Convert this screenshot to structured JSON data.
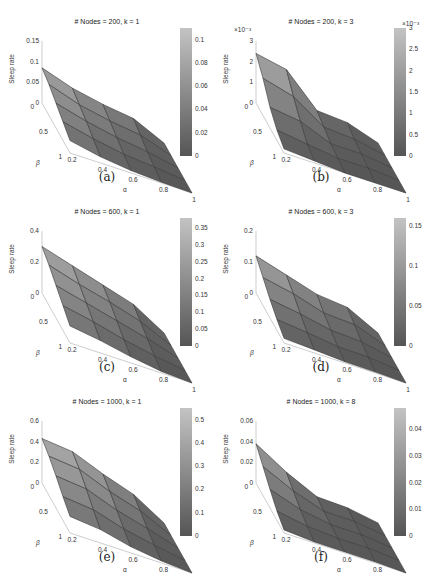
{
  "figure": {
    "panels": [
      {
        "id": "a",
        "caption": "(a)",
        "title": "# Nodes = 200,  k = 1"
      },
      {
        "id": "b",
        "caption": "(b)",
        "title": "# Nodes = 200,  k = 3"
      },
      {
        "id": "c",
        "caption": "(c)",
        "title": "# Nodes = 600,  k = 1"
      },
      {
        "id": "d",
        "caption": "(d)",
        "title": "# Nodes = 600,  k = 3"
      },
      {
        "id": "e",
        "caption": "(e)",
        "title": "# Nodes = 1000,  k = 1"
      },
      {
        "id": "f",
        "caption": "(f)",
        "title": "# Nodes = 1000,  k = 8"
      }
    ]
  },
  "chart_data": [
    {
      "type": "surface",
      "title": "# Nodes = 200,  k = 1",
      "caption": "(a)",
      "xlabel": "α",
      "ylabel": "β",
      "zlabel": "Sleep rate",
      "x_ticks": [
        "0.2",
        "0.4",
        "0.6",
        "0.8",
        "1"
      ],
      "y_ticks": [
        "0",
        "0.5",
        "1"
      ],
      "z_ticks": [
        "0",
        "0.05",
        "0.1",
        "0.15"
      ],
      "zlim": [
        0,
        0.15
      ],
      "colorbar_ticks": [
        "0",
        "0.02",
        "0.04",
        "0.06",
        "0.08",
        "0.1"
      ],
      "colorbar_range": [
        0,
        0.11
      ],
      "alpha": [
        0.2,
        0.4,
        0.6,
        0.8,
        1.0
      ],
      "beta": [
        0,
        0.25,
        0.5,
        0.75,
        1.0
      ],
      "z": [
        [
          0.085,
          0.06,
          0.045,
          0.035,
          0.0
        ],
        [
          0.075,
          0.05,
          0.035,
          0.025,
          0.0
        ],
        [
          0.06,
          0.04,
          0.025,
          0.015,
          0.0
        ],
        [
          0.045,
          0.028,
          0.015,
          0.008,
          0.0
        ],
        [
          0.03,
          0.015,
          0.006,
          0.002,
          0.0
        ]
      ]
    },
    {
      "type": "surface",
      "title": "# Nodes = 200,  k = 3",
      "caption": "(b)",
      "xlabel": "α",
      "ylabel": "β",
      "zlabel": "Sleep rate",
      "z_multiplier": "×10^-3",
      "x_ticks": [
        "0.2",
        "0.4",
        "0.6",
        "0.8",
        "1"
      ],
      "y_ticks": [
        "0",
        "0.5",
        "1"
      ],
      "z_ticks": [
        "0",
        "1",
        "2",
        "3"
      ],
      "zlim": [
        0,
        0.003
      ],
      "colorbar_ticks": [
        "0",
        "0.5",
        "1",
        "1.5",
        "2",
        "2.5",
        "3"
      ],
      "colorbar_range": [
        0,
        0.003
      ],
      "alpha": [
        0.2,
        0.4,
        0.6,
        0.8,
        1.0
      ],
      "beta": [
        0,
        0.25,
        0.5,
        0.75,
        1.0
      ],
      "z": [
        [
          0.0024,
          0.0021,
          0.0006,
          0.0005,
          0.0
        ],
        [
          0.0018,
          0.0014,
          0.0004,
          0.0003,
          0.0
        ],
        [
          0.001,
          0.0008,
          0.0002,
          0.0002,
          0.0
        ],
        [
          0.0005,
          0.0003,
          0.0001,
          0.0001,
          0.0
        ],
        [
          0.0002,
          0.0001,
          0.0,
          0.0,
          0.0
        ]
      ]
    },
    {
      "type": "surface",
      "title": "# Nodes = 600,  k = 1",
      "caption": "(c)",
      "xlabel": "α",
      "ylabel": "β",
      "zlabel": "Sleep rate",
      "x_ticks": [
        "0.2",
        "0.4",
        "0.6",
        "0.8",
        "1"
      ],
      "y_ticks": [
        "0",
        "0.5",
        "1"
      ],
      "z_ticks": [
        "0",
        "0.2",
        "0.4"
      ],
      "zlim": [
        0,
        0.4
      ],
      "colorbar_ticks": [
        "0",
        "0.05",
        "0.1",
        "0.15",
        "0.2",
        "0.25",
        "0.3",
        "0.35"
      ],
      "colorbar_range": [
        0,
        0.38
      ],
      "alpha": [
        0.2,
        0.4,
        0.6,
        0.8,
        1.0
      ],
      "beta": [
        0,
        0.25,
        0.5,
        0.75,
        1.0
      ],
      "z": [
        [
          0.3,
          0.24,
          0.18,
          0.12,
          0.0
        ],
        [
          0.26,
          0.2,
          0.15,
          0.09,
          0.0
        ],
        [
          0.21,
          0.16,
          0.11,
          0.06,
          0.0
        ],
        [
          0.16,
          0.12,
          0.07,
          0.03,
          0.0
        ],
        [
          0.11,
          0.08,
          0.04,
          0.01,
          0.0
        ]
      ]
    },
    {
      "type": "surface",
      "title": "# Nodes = 600,  k = 3",
      "caption": "(d)",
      "xlabel": "α",
      "ylabel": "β",
      "zlabel": "Sleep rate",
      "x_ticks": [
        "0.2",
        "0.4",
        "0.6",
        "0.8",
        "1"
      ],
      "y_ticks": [
        "0",
        "0.5",
        "1"
      ],
      "z_ticks": [
        "0",
        "0.1",
        "0.2"
      ],
      "zlim": [
        0,
        0.2
      ],
      "colorbar_ticks": [
        "0",
        "0.05",
        "0.1",
        "0.15"
      ],
      "colorbar_range": [
        0,
        0.16
      ],
      "alpha": [
        0.2,
        0.4,
        0.6,
        0.8,
        1.0
      ],
      "beta": [
        0,
        0.25,
        0.5,
        0.75,
        1.0
      ],
      "z": [
        [
          0.12,
          0.09,
          0.06,
          0.05,
          0.0
        ],
        [
          0.09,
          0.07,
          0.04,
          0.035,
          0.0
        ],
        [
          0.06,
          0.045,
          0.025,
          0.02,
          0.0
        ],
        [
          0.035,
          0.025,
          0.012,
          0.01,
          0.0
        ],
        [
          0.015,
          0.01,
          0.004,
          0.003,
          0.0
        ]
      ]
    },
    {
      "type": "surface",
      "title": "# Nodes = 1000,  k = 1",
      "caption": "(e)",
      "xlabel": "α",
      "ylabel": "β",
      "zlabel": "Sleep rate",
      "x_ticks": [
        "0.2",
        "0.4",
        "0.6",
        "0.8",
        "1"
      ],
      "y_ticks": [
        "0",
        "0.5",
        "1"
      ],
      "z_ticks": [
        "0",
        "0.2",
        "0.4",
        "0.6"
      ],
      "zlim": [
        0,
        0.6
      ],
      "colorbar_ticks": [
        "0",
        "0.1",
        "0.2",
        "0.3",
        "0.4",
        "0.5"
      ],
      "colorbar_range": [
        0,
        0.55
      ],
      "alpha": [
        0.2,
        0.4,
        0.6,
        0.8,
        1.0
      ],
      "beta": [
        0,
        0.25,
        0.5,
        0.75,
        1.0
      ],
      "z": [
        [
          0.43,
          0.4,
          0.28,
          0.18,
          0.0
        ],
        [
          0.38,
          0.35,
          0.23,
          0.14,
          0.0
        ],
        [
          0.31,
          0.28,
          0.17,
          0.09,
          0.0
        ],
        [
          0.23,
          0.2,
          0.11,
          0.05,
          0.0
        ],
        [
          0.16,
          0.13,
          0.06,
          0.02,
          0.0
        ]
      ]
    },
    {
      "type": "surface",
      "title": "# Nodes = 1000,  k = 8",
      "caption": "(f)",
      "xlabel": "α",
      "ylabel": "β",
      "zlabel": "Sleep rate",
      "x_ticks": [
        "0.2",
        "0.4",
        "0.6",
        "0.8",
        "1"
      ],
      "y_ticks": [
        "0",
        "0.5",
        "1"
      ],
      "z_ticks": [
        "0",
        "0.02",
        "0.04",
        "0.06"
      ],
      "zlim": [
        0,
        0.06
      ],
      "colorbar_ticks": [
        "0",
        "0.01",
        "0.02",
        "0.03",
        "0.04"
      ],
      "colorbar_range": [
        0,
        0.048
      ],
      "alpha": [
        0.2,
        0.4,
        0.6,
        0.8,
        1.0
      ],
      "beta": [
        0,
        0.25,
        0.5,
        0.75,
        1.0
      ],
      "z": [
        [
          0.038,
          0.02,
          0.006,
          0.005,
          0.0
        ],
        [
          0.028,
          0.014,
          0.004,
          0.004,
          0.0
        ],
        [
          0.018,
          0.008,
          0.003,
          0.003,
          0.0
        ],
        [
          0.009,
          0.004,
          0.002,
          0.002,
          0.0
        ],
        [
          0.003,
          0.001,
          0.001,
          0.001,
          0.0
        ]
      ]
    }
  ]
}
